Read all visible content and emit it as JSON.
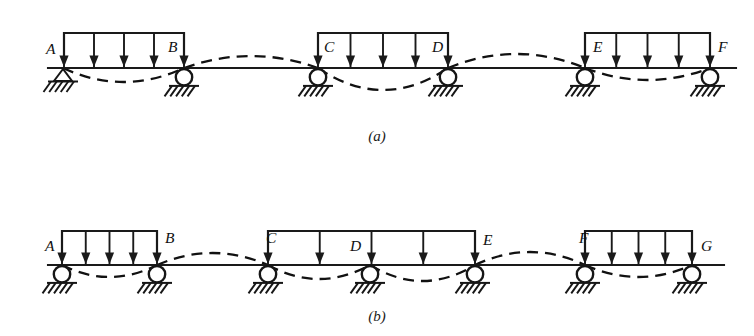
{
  "figure": {
    "ink_color": "#1a1a1a",
    "background": "#ffffff"
  },
  "captions": {
    "a": "(a)",
    "b": "(b)"
  },
  "diagram_a": {
    "name": "continuous-beam-a",
    "beam_y": 68,
    "beam_x_start": 48,
    "beam_x_end": 736,
    "supports": [
      {
        "label": "A",
        "x": 63,
        "type": "pin",
        "label_dx": -17,
        "label_dy": -14
      },
      {
        "label": "B",
        "x": 184,
        "type": "roller",
        "label_dx": -16,
        "label_dy": -16
      },
      {
        "label": "C",
        "x": 318,
        "type": "roller",
        "label_dx": 6,
        "label_dy": -16
      },
      {
        "label": "D",
        "x": 448,
        "type": "roller",
        "label_dx": -16,
        "label_dy": -16
      },
      {
        "label": "E",
        "x": 585,
        "type": "roller",
        "label_dx": 8,
        "label_dy": -16
      },
      {
        "label": "F",
        "x": 710,
        "type": "roller",
        "label_dx": 8,
        "label_dy": -16
      }
    ],
    "loaded_spans": [
      {
        "from": "A",
        "to": "B",
        "x_start": 64,
        "x_end": 184,
        "arrows": 5,
        "bar_y": 33
      },
      {
        "from": "C",
        "to": "D",
        "x_start": 318,
        "x_end": 448,
        "arrows": 5,
        "bar_y": 33
      },
      {
        "from": "E",
        "to": "F",
        "x_start": 585,
        "x_end": 710,
        "arrows": 5,
        "bar_y": 33
      }
    ],
    "deflection": {
      "description": "dashed elastic curve: sagging under loaded spans, hogging over unloaded spans",
      "spans": [
        {
          "from": 63,
          "to": 184,
          "sag": 14
        },
        {
          "from": 184,
          "to": 318,
          "sag": -12
        },
        {
          "from": 318,
          "to": 448,
          "sag": 22
        },
        {
          "from": 448,
          "to": 585,
          "sag": -14
        },
        {
          "from": 585,
          "to": 710,
          "sag": 12
        }
      ]
    }
  },
  "diagram_b": {
    "name": "continuous-beam-b",
    "beam_y": 265,
    "beam_x_start": 48,
    "beam_x_end": 724,
    "supports": [
      {
        "label": "A",
        "x": 62,
        "type": "roller",
        "label_dx": -17,
        "label_dy": -14
      },
      {
        "label": "B",
        "x": 157,
        "type": "roller",
        "label_dx": 8,
        "label_dy": -22
      },
      {
        "label": "C",
        "x": 268,
        "type": "roller",
        "label_dx": -2,
        "label_dy": -22
      },
      {
        "label": "D",
        "x": 370,
        "type": "roller",
        "label_dx": -20,
        "label_dy": -14
      },
      {
        "label": "E",
        "x": 475,
        "type": "roller",
        "label_dx": 8,
        "label_dy": -20
      },
      {
        "label": "F",
        "x": 585,
        "type": "roller",
        "label_dx": -6,
        "label_dy": -22
      },
      {
        "label": "G",
        "x": 692,
        "type": "roller",
        "label_dx": 9,
        "label_dy": -14
      }
    ],
    "loaded_spans": [
      {
        "from": "A",
        "to": "B",
        "x_start": 62,
        "x_end": 157,
        "arrows": 5,
        "bar_y": 231
      },
      {
        "from": "C",
        "to": "E",
        "x_start": 268,
        "x_end": 475,
        "arrows": 5,
        "bar_y": 231
      },
      {
        "from": "F",
        "to": "G",
        "x_start": 585,
        "x_end": 692,
        "arrows": 5,
        "bar_y": 231
      }
    ],
    "deflection": {
      "description": "dashed elastic curve: sagging under loaded spans, hogging over unloaded spans",
      "spans": [
        {
          "from": 62,
          "to": 157,
          "sag": 12
        },
        {
          "from": 157,
          "to": 268,
          "sag": -12
        },
        {
          "from": 268,
          "to": 370,
          "sag": 14
        },
        {
          "from": 370,
          "to": 475,
          "sag": 16
        },
        {
          "from": 475,
          "to": 585,
          "sag": -13
        },
        {
          "from": 585,
          "to": 692,
          "sag": 12
        }
      ]
    }
  }
}
